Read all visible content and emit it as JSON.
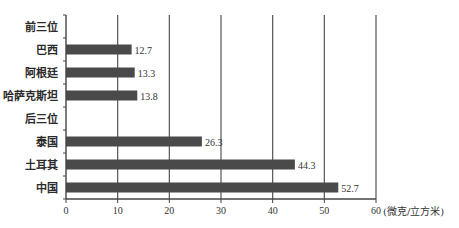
{
  "chart_data": {
    "type": "bar",
    "orientation": "horizontal",
    "title": "",
    "xlabel": "(微克/立方米)",
    "ylabel": "",
    "xlim": [
      0,
      60
    ],
    "xticks": [
      0,
      10,
      20,
      30,
      40,
      50,
      60
    ],
    "grid": "vertical",
    "legend": null,
    "categories": [
      "前三位",
      "巴西",
      "阿根廷",
      "哈萨克斯坦",
      "后三位",
      "泰国",
      "土耳其",
      "中国"
    ],
    "values": [
      null,
      12.7,
      13.3,
      13.8,
      null,
      26.3,
      44.3,
      52.7
    ],
    "value_labels": [
      "",
      "12.7",
      "13.3",
      "13.8",
      "",
      "26.3",
      "44.3",
      "52.7"
    ],
    "group_headers": [
      "前三位",
      "后三位"
    ],
    "bar_color": "#4a4a4a"
  }
}
